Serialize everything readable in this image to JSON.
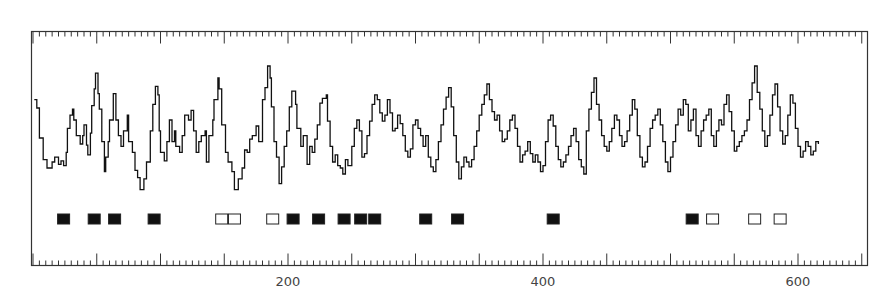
{
  "chart_data": {
    "type": "line",
    "title": "",
    "xlabel": "",
    "ylabel": "",
    "xlim": [
      0,
      653
    ],
    "x_tick_labels": [
      "200",
      "400",
      "600"
    ],
    "x_tick_values": [
      200,
      400,
      600
    ],
    "major_tick_interval": 50,
    "minor_tick_interval": 5,
    "grid": false,
    "legend": null,
    "colors": {
      "line": "#111111",
      "frame": "#333333",
      "marker": "#111111",
      "text": "#444444"
    },
    "series": [
      {
        "name": "profile-trace",
        "note": "x in axis units, y in relative height (0 = trace bottom, 100 = highest peak)",
        "points": [
          [
            1,
            82
          ],
          [
            3,
            75
          ],
          [
            5,
            50
          ],
          [
            8,
            32
          ],
          [
            11,
            25
          ],
          [
            15,
            30
          ],
          [
            17,
            34
          ],
          [
            20,
            28
          ],
          [
            22,
            31
          ],
          [
            24,
            27
          ],
          [
            26,
            38
          ],
          [
            27,
            58
          ],
          [
            29,
            69
          ],
          [
            31,
            74
          ],
          [
            32,
            65
          ],
          [
            34,
            52
          ],
          [
            37,
            45
          ],
          [
            39,
            52
          ],
          [
            40,
            61
          ],
          [
            42,
            44
          ],
          [
            43,
            36
          ],
          [
            45,
            54
          ],
          [
            46,
            77
          ],
          [
            48,
            91
          ],
          [
            49,
            104
          ],
          [
            51,
            87
          ],
          [
            52,
            74
          ],
          [
            54,
            47
          ],
          [
            56,
            22
          ],
          [
            57,
            34
          ],
          [
            59,
            47
          ],
          [
            60,
            65
          ],
          [
            63,
            87
          ],
          [
            65,
            65
          ],
          [
            67,
            52
          ],
          [
            69,
            43
          ],
          [
            71,
            56
          ],
          [
            74,
            69
          ],
          [
            75,
            47
          ],
          [
            78,
            38
          ],
          [
            80,
            23
          ],
          [
            82,
            17
          ],
          [
            84,
            7
          ],
          [
            87,
            16
          ],
          [
            89,
            30
          ],
          [
            92,
            56
          ],
          [
            94,
            78
          ],
          [
            96,
            93
          ],
          [
            98,
            86
          ],
          [
            99,
            56
          ],
          [
            100,
            38
          ],
          [
            103,
            31
          ],
          [
            105,
            47
          ],
          [
            107,
            65
          ],
          [
            109,
            47
          ],
          [
            111,
            56
          ],
          [
            112,
            43
          ],
          [
            115,
            38
          ],
          [
            117,
            52
          ],
          [
            119,
            69
          ],
          [
            122,
            65
          ],
          [
            124,
            73
          ],
          [
            126,
            56
          ],
          [
            128,
            38
          ],
          [
            130,
            47
          ],
          [
            132,
            52
          ],
          [
            135,
            56
          ],
          [
            136,
            30
          ],
          [
            138,
            52
          ],
          [
            141,
            65
          ],
          [
            142,
            82
          ],
          [
            145,
            100
          ],
          [
            146,
            91
          ],
          [
            148,
            61
          ],
          [
            151,
            38
          ],
          [
            153,
            30
          ],
          [
            156,
            22
          ],
          [
            158,
            7
          ],
          [
            161,
            16
          ],
          [
            164,
            25
          ],
          [
            166,
            40
          ],
          [
            168,
            38
          ],
          [
            170,
            49
          ],
          [
            172,
            52
          ],
          [
            175,
            60
          ],
          [
            177,
            47
          ],
          [
            180,
            82
          ],
          [
            182,
            92
          ],
          [
            184,
            110
          ],
          [
            186,
            100
          ],
          [
            187,
            76
          ],
          [
            189,
            47
          ],
          [
            191,
            34
          ],
          [
            193,
            12
          ],
          [
            195,
            26
          ],
          [
            197,
            43
          ],
          [
            199,
            56
          ],
          [
            201,
            76
          ],
          [
            203,
            89
          ],
          [
            206,
            78
          ],
          [
            207,
            58
          ],
          [
            210,
            43
          ],
          [
            212,
            52
          ],
          [
            215,
            28
          ],
          [
            217,
            43
          ],
          [
            219,
            38
          ],
          [
            221,
            49
          ],
          [
            223,
            61
          ],
          [
            225,
            79
          ],
          [
            227,
            83
          ],
          [
            230,
            86
          ],
          [
            231,
            64
          ],
          [
            233,
            43
          ],
          [
            235,
            30
          ],
          [
            237,
            36
          ],
          [
            239,
            27
          ],
          [
            241,
            25
          ],
          [
            243,
            20
          ],
          [
            245,
            32
          ],
          [
            247,
            27
          ],
          [
            250,
            43
          ],
          [
            252,
            58
          ],
          [
            254,
            65
          ],
          [
            256,
            56
          ],
          [
            258,
            34
          ],
          [
            260,
            37
          ],
          [
            262,
            52
          ],
          [
            264,
            64
          ],
          [
            266,
            78
          ],
          [
            268,
            86
          ],
          [
            270,
            82
          ],
          [
            272,
            71
          ],
          [
            274,
            64
          ],
          [
            276,
            69
          ],
          [
            278,
            82
          ],
          [
            280,
            71
          ],
          [
            282,
            56
          ],
          [
            284,
            58
          ],
          [
            286,
            69
          ],
          [
            288,
            62
          ],
          [
            290,
            52
          ],
          [
            292,
            39
          ],
          [
            294,
            34
          ],
          [
            296,
            41
          ],
          [
            298,
            61
          ],
          [
            300,
            65
          ],
          [
            302,
            58
          ],
          [
            304,
            52
          ],
          [
            306,
            43
          ],
          [
            308,
            52
          ],
          [
            310,
            34
          ],
          [
            312,
            26
          ],
          [
            314,
            22
          ],
          [
            316,
            32
          ],
          [
            318,
            47
          ],
          [
            320,
            61
          ],
          [
            322,
            74
          ],
          [
            324,
            84
          ],
          [
            326,
            92
          ],
          [
            328,
            76
          ],
          [
            330,
            52
          ],
          [
            332,
            30
          ],
          [
            334,
            16
          ],
          [
            336,
            26
          ],
          [
            338,
            34
          ],
          [
            340,
            30
          ],
          [
            342,
            26
          ],
          [
            344,
            32
          ],
          [
            346,
            43
          ],
          [
            348,
            56
          ],
          [
            350,
            69
          ],
          [
            352,
            78
          ],
          [
            354,
            86
          ],
          [
            356,
            95
          ],
          [
            358,
            82
          ],
          [
            360,
            72
          ],
          [
            362,
            65
          ],
          [
            364,
            69
          ],
          [
            366,
            56
          ],
          [
            368,
            47
          ],
          [
            370,
            49
          ],
          [
            372,
            56
          ],
          [
            374,
            65
          ],
          [
            376,
            69
          ],
          [
            378,
            58
          ],
          [
            380,
            43
          ],
          [
            382,
            30
          ],
          [
            384,
            36
          ],
          [
            386,
            39
          ],
          [
            388,
            47
          ],
          [
            390,
            37
          ],
          [
            392,
            30
          ],
          [
            394,
            36
          ],
          [
            396,
            30
          ],
          [
            398,
            22
          ],
          [
            400,
            27
          ],
          [
            402,
            47
          ],
          [
            404,
            65
          ],
          [
            406,
            69
          ],
          [
            408,
            60
          ],
          [
            410,
            43
          ],
          [
            412,
            32
          ],
          [
            414,
            26
          ],
          [
            416,
            30
          ],
          [
            418,
            36
          ],
          [
            420,
            43
          ],
          [
            422,
            52
          ],
          [
            424,
            58
          ],
          [
            426,
            47
          ],
          [
            428,
            32
          ],
          [
            430,
            26
          ],
          [
            432,
            20
          ],
          [
            434,
            56
          ],
          [
            436,
            74
          ],
          [
            438,
            88
          ],
          [
            440,
            100
          ],
          [
            442,
            78
          ],
          [
            444,
            65
          ],
          [
            446,
            52
          ],
          [
            448,
            43
          ],
          [
            450,
            39
          ],
          [
            452,
            47
          ],
          [
            454,
            58
          ],
          [
            456,
            69
          ],
          [
            458,
            65
          ],
          [
            460,
            52
          ],
          [
            462,
            43
          ],
          [
            464,
            47
          ],
          [
            466,
            56
          ],
          [
            468,
            69
          ],
          [
            470,
            82
          ],
          [
            472,
            74
          ],
          [
            474,
            52
          ],
          [
            476,
            34
          ],
          [
            478,
            26
          ],
          [
            480,
            30
          ],
          [
            482,
            43
          ],
          [
            484,
            58
          ],
          [
            486,
            65
          ],
          [
            488,
            69
          ],
          [
            490,
            74
          ],
          [
            492,
            61
          ],
          [
            494,
            47
          ],
          [
            496,
            30
          ],
          [
            498,
            22
          ],
          [
            500,
            34
          ],
          [
            502,
            47
          ],
          [
            504,
            61
          ],
          [
            506,
            74
          ],
          [
            508,
            69
          ],
          [
            510,
            82
          ],
          [
            512,
            78
          ],
          [
            514,
            56
          ],
          [
            516,
            65
          ],
          [
            518,
            74
          ],
          [
            520,
            52
          ],
          [
            522,
            43
          ],
          [
            524,
            56
          ],
          [
            526,
            65
          ],
          [
            528,
            69
          ],
          [
            530,
            74
          ],
          [
            532,
            52
          ],
          [
            534,
            43
          ],
          [
            536,
            56
          ],
          [
            538,
            65
          ],
          [
            540,
            61
          ],
          [
            542,
            78
          ],
          [
            544,
            86
          ],
          [
            546,
            72
          ],
          [
            548,
            56
          ],
          [
            550,
            39
          ],
          [
            552,
            43
          ],
          [
            554,
            47
          ],
          [
            556,
            52
          ],
          [
            558,
            56
          ],
          [
            560,
            65
          ],
          [
            562,
            82
          ],
          [
            564,
            96
          ],
          [
            566,
            110
          ],
          [
            568,
            88
          ],
          [
            570,
            74
          ],
          [
            572,
            56
          ],
          [
            574,
            43
          ],
          [
            576,
            52
          ],
          [
            578,
            69
          ],
          [
            580,
            86
          ],
          [
            582,
            95
          ],
          [
            584,
            76
          ],
          [
            586,
            56
          ],
          [
            588,
            45
          ],
          [
            590,
            52
          ],
          [
            592,
            69
          ],
          [
            594,
            86
          ],
          [
            596,
            79
          ],
          [
            598,
            58
          ],
          [
            600,
            43
          ],
          [
            602,
            34
          ],
          [
            604,
            39
          ],
          [
            606,
            47
          ],
          [
            608,
            43
          ],
          [
            610,
            36
          ],
          [
            612,
            39
          ],
          [
            614,
            47
          ],
          [
            616,
            45
          ]
        ]
      }
    ],
    "markers": {
      "filled": [
        24,
        48,
        64,
        95,
        204,
        224,
        244,
        257,
        268,
        308,
        333,
        408,
        517
      ],
      "open": [
        148,
        158,
        188,
        533,
        566,
        586
      ]
    }
  }
}
